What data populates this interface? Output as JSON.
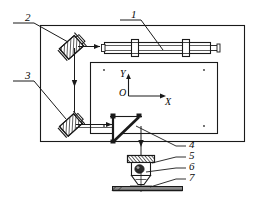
{
  "figure": {
    "type": "engineering-line-diagram",
    "width": 257,
    "height": 207,
    "line_color": "#1a1a1a",
    "background": "#ffffff"
  },
  "callouts": [
    {
      "id": "1",
      "label": "1",
      "x": 131,
      "y": 10,
      "target": "horizontal-guide-rail"
    },
    {
      "id": "2",
      "label": "2",
      "x": 18,
      "y": 14,
      "target": "upper-left-beam-splitter"
    },
    {
      "id": "3",
      "label": "3",
      "x": 18,
      "y": 72,
      "target": "lower-left-beam-splitter"
    },
    {
      "id": "4",
      "label": "4",
      "x": 188,
      "y": 141,
      "target": "focusing-mirror"
    },
    {
      "id": "5",
      "label": "5",
      "x": 188,
      "y": 152,
      "target": "nozzle-head"
    },
    {
      "id": "6",
      "label": "6",
      "x": 188,
      "y": 163,
      "target": "lens-assembly"
    },
    {
      "id": "7",
      "label": "7",
      "x": 188,
      "y": 174,
      "target": "workpiece-plate"
    }
  ],
  "axes": {
    "origin_label": "O",
    "x_label": "X",
    "y_label": "Y",
    "origin_x": 128,
    "origin_y": 96,
    "x_arrow_end": 166,
    "y_arrow_end": 74
  },
  "components": {
    "outer_frame": {
      "name": "machine-outer-frame",
      "x": 40,
      "y": 25,
      "width": 205,
      "height": 117
    },
    "inner_table": {
      "name": "work-table",
      "x": 90,
      "y": 62,
      "width": 128,
      "height": 72
    },
    "guide_rail": {
      "name": "horizontal-guide-rail",
      "x": 104,
      "y": 42,
      "width": 108,
      "height": 12
    },
    "upper_splitter": {
      "name": "upper-left-beam-splitter",
      "x": 62,
      "y": 34,
      "size": 24,
      "rotation": -45
    },
    "lower_splitter": {
      "name": "lower-left-beam-splitter",
      "x": 60,
      "y": 114,
      "size": 22,
      "rotation": -45
    },
    "prism_mirror": {
      "name": "triangular-prism-mirror",
      "x": 112,
      "y": 116,
      "size": 26
    },
    "nozzle": {
      "name": "nozzle-head",
      "x": 130,
      "y": 155,
      "width": 26,
      "height": 30
    },
    "workpiece": {
      "name": "workpiece-plate",
      "x": 112,
      "y": 186,
      "width": 70,
      "height": 4
    }
  },
  "beam_paths": [
    {
      "name": "beam-top-horizontal",
      "from": [
        74,
        46
      ],
      "to": [
        104,
        46
      ]
    },
    {
      "name": "beam-left-vertical",
      "from": [
        74,
        46
      ],
      "to": [
        74,
        124
      ]
    },
    {
      "name": "beam-lower-horizontal",
      "from": [
        74,
        124
      ],
      "to": [
        120,
        124
      ]
    },
    {
      "name": "beam-vertical-to-nozzle",
      "from": [
        126,
        128
      ],
      "to": [
        126,
        156
      ]
    }
  ]
}
